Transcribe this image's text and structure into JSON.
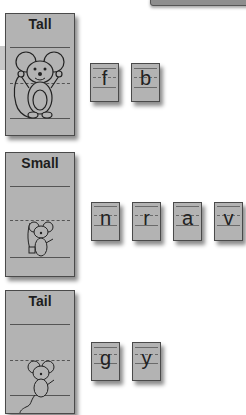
{
  "cards": [
    {
      "title": "Tall",
      "letters": [
        "f",
        "b"
      ]
    },
    {
      "title": "Small",
      "letters": [
        "n",
        "r",
        "a",
        "v"
      ]
    },
    {
      "title": "Tail",
      "letters": [
        "g",
        "y"
      ]
    }
  ],
  "colors": {
    "card_fill": "#b3b3b3",
    "card_border": "#4a4a4a",
    "text": "#1e1e1e"
  }
}
